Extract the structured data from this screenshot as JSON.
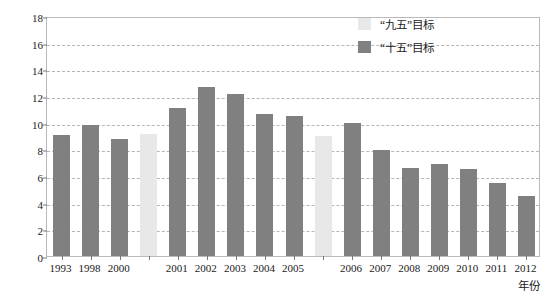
{
  "chart_data": {
    "type": "bar",
    "title": "",
    "xlabel": "年份",
    "ylabel": "NH3-N/(万 t/a)",
    "ylabel_parts": {
      "prefix": "NH",
      "sub": "3",
      "suffix": "-N/(万 t/a)"
    },
    "ylim": [
      0,
      18
    ],
    "ytick_step": 2,
    "yticks": [
      "0",
      "2",
      "4",
      "6",
      "8",
      "10",
      "12",
      "14",
      "16",
      "18"
    ],
    "grid": "horizontal-dashed",
    "legend_position": "top-right",
    "categories": [
      "1993",
      "1998",
      "2000",
      "",
      "2001",
      "2002",
      "2003",
      "2004",
      "2005",
      "",
      "2006",
      "2007",
      "2008",
      "2009",
      "2010",
      "2011",
      "2012"
    ],
    "values": [
      9.05,
      9.85,
      8.75,
      9.15,
      11.1,
      12.65,
      12.15,
      10.65,
      10.5,
      9.0,
      10.0,
      7.95,
      6.6,
      6.9,
      6.55,
      5.5,
      4.5
    ],
    "bars": [
      {
        "label": "1993",
        "value": 9.05,
        "series": "十五目标"
      },
      {
        "label": "1998",
        "value": 9.85,
        "series": "十五目标"
      },
      {
        "label": "2000",
        "value": 8.75,
        "series": "十五目标"
      },
      {
        "label": "",
        "value": 9.15,
        "series": "九五目标"
      },
      {
        "label": "2001",
        "value": 11.1,
        "series": "十五目标"
      },
      {
        "label": "2002",
        "value": 12.65,
        "series": "十五目标"
      },
      {
        "label": "2003",
        "value": 12.15,
        "series": "十五目标"
      },
      {
        "label": "2004",
        "value": 10.65,
        "series": "十五目标"
      },
      {
        "label": "2005",
        "value": 10.5,
        "series": "十五目标"
      },
      {
        "label": "",
        "value": 9.0,
        "series": "九五目标"
      },
      {
        "label": "2006",
        "value": 10.0,
        "series": "十五目标"
      },
      {
        "label": "2007",
        "value": 7.95,
        "series": "十五目标"
      },
      {
        "label": "2008",
        "value": 6.6,
        "series": "十五目标"
      },
      {
        "label": "2009",
        "value": 6.9,
        "series": "十五目标"
      },
      {
        "label": "2010",
        "value": 6.55,
        "series": "十五目标"
      },
      {
        "label": "2011",
        "value": 5.5,
        "series": "十五目标"
      },
      {
        "label": "2012",
        "value": 4.5,
        "series": "十五目标"
      }
    ],
    "legend": [
      {
        "label": "“九五”目标",
        "color": "#e8e8e8",
        "key": "light"
      },
      {
        "label": "“十五”目标",
        "color": "#808080",
        "key": "dark"
      }
    ],
    "colors": {
      "bar_dark": "#808080",
      "bar_light": "#e8e8e8",
      "gridline": "#b5b5b5",
      "frame": "#b9b9b9",
      "text": "#1a1a1a"
    }
  },
  "caption": {
    "text": ""
  }
}
